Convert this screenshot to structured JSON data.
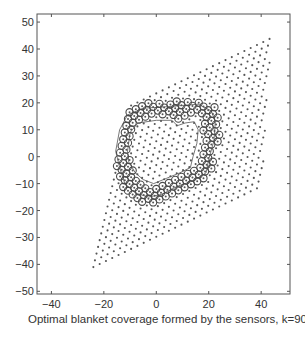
{
  "chart_data": {
    "type": "scatter",
    "title": "",
    "xlabel": "Optimal blanket coverage formed by the sensors, k=90",
    "ylabel": "",
    "xlim": [
      -45.5,
      51
    ],
    "ylim": [
      -51,
      53
    ],
    "grid": false,
    "legend": null,
    "x_ticks": [
      -40,
      -20,
      0,
      20,
      40
    ],
    "y_ticks": [
      50,
      40,
      30,
      20,
      10,
      0,
      -10,
      -20,
      -30,
      -40,
      -50
    ],
    "x_tick_labels": [
      "−40",
      "−20",
      "0",
      "20",
      "40"
    ],
    "y_tick_labels": [
      "50",
      "40",
      "30",
      "20",
      "10",
      "0",
      "−10",
      "−20",
      "−30",
      "−40",
      "−50"
    ],
    "k": 90,
    "series": [
      {
        "name": "candidate grid points",
        "marker": "dot",
        "region": "parallelogram",
        "corners": [
          [
            -24,
            -41
          ],
          [
            40,
            -11
          ],
          [
            44,
            49
          ],
          [
            -20,
            20
          ]
        ],
        "lattice": {
          "origin": [
            -24,
            -41
          ],
          "u": [
            2.4,
            1.125
          ],
          "v": [
            0.6,
            2.5
          ],
          "nu": 27,
          "nv": 25
        }
      },
      {
        "name": "selected sensors (blanket)",
        "marker": "circle-dot",
        "count_note": "sensors forming annular barrier",
        "outer_boundary": [
          [
            -15,
            4
          ],
          [
            -14,
            12
          ],
          [
            -11,
            17
          ],
          [
            -5,
            20
          ],
          [
            3,
            20.5
          ],
          [
            10,
            21
          ],
          [
            16,
            21.5
          ],
          [
            22,
            19
          ],
          [
            24.5,
            15
          ],
          [
            24,
            8
          ],
          [
            22,
            0
          ],
          [
            21,
            -6
          ],
          [
            17,
            -10
          ],
          [
            10,
            -12
          ],
          [
            4,
            -16
          ],
          [
            -2,
            -18
          ],
          [
            -8,
            -16
          ],
          [
            -13,
            -12
          ],
          [
            -15.5,
            -5
          ]
        ],
        "inner_boundary": [
          [
            -10,
            3
          ],
          [
            -9,
            10
          ],
          [
            -6,
            14
          ],
          [
            0,
            15.5
          ],
          [
            6,
            15.5
          ],
          [
            9,
            13
          ],
          [
            12,
            14.5
          ],
          [
            16,
            15.5
          ],
          [
            18,
            12
          ],
          [
            17.5,
            6
          ],
          [
            16,
            0
          ],
          [
            15,
            -4
          ],
          [
            10,
            -7
          ],
          [
            4,
            -10
          ],
          [
            -1,
            -12
          ],
          [
            -5,
            -10
          ],
          [
            -8,
            -7
          ],
          [
            -10,
            -3
          ]
        ]
      }
    ],
    "contours": [
      {
        "name": "outer contour",
        "points": [
          [
            -15.5,
            2
          ],
          [
            -14,
            10
          ],
          [
            -11,
            15.5
          ],
          [
            -5,
            18
          ],
          [
            3,
            18.5
          ],
          [
            10,
            19
          ],
          [
            16,
            19.5
          ],
          [
            21,
            17
          ],
          [
            22.5,
            13
          ],
          [
            22,
            6
          ],
          [
            20,
            -1
          ],
          [
            19,
            -6
          ],
          [
            14,
            -9
          ],
          [
            8,
            -11
          ],
          [
            2,
            -14
          ],
          [
            -3,
            -15
          ],
          [
            -8,
            -13.5
          ],
          [
            -12,
            -10
          ],
          [
            -14,
            -4
          ]
        ]
      },
      {
        "name": "inner contour",
        "points": [
          [
            -11,
            2
          ],
          [
            -10,
            9
          ],
          [
            -7,
            12.5
          ],
          [
            0,
            13.5
          ],
          [
            6,
            13.5
          ],
          [
            8,
            11.5
          ],
          [
            11,
            12.5
          ],
          [
            14.5,
            13
          ],
          [
            16,
            10
          ],
          [
            15.5,
            5
          ],
          [
            14,
            0
          ],
          [
            13,
            -4
          ],
          [
            9,
            -6
          ],
          [
            4,
            -8
          ],
          [
            -1,
            -10
          ],
          [
            -5,
            -8.5
          ],
          [
            -8,
            -6
          ],
          [
            -10.5,
            -2
          ]
        ]
      }
    ],
    "colors": {
      "axis": "#555555",
      "dot": "#555555",
      "circle": "#4a4a4a",
      "contour": "#555555"
    }
  }
}
